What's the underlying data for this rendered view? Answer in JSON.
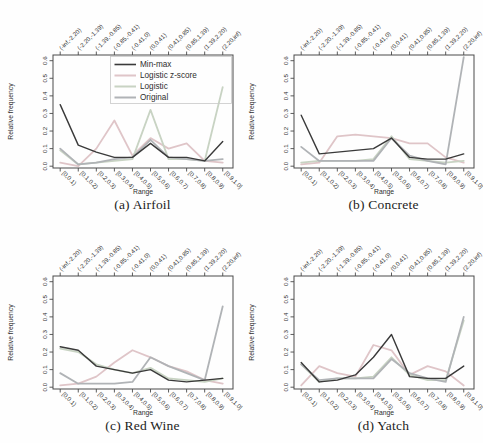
{
  "figure": {
    "background": "#fefefe",
    "frame_color": "#4a4a4a",
    "tick_color": "#4a4a4a"
  },
  "axes": {
    "ylabel": "Relative frequency",
    "xlabel": "Range",
    "yticks": [
      "0.0",
      "0.1",
      "0.2",
      "0.3",
      "0.4",
      "0.5",
      "0.6"
    ],
    "ylim": [
      0,
      0.6
    ],
    "x_categories_bottom": [
      "[0,0.1)",
      "[0.1,0.2)",
      "[0.2,0.3)",
      "[0.3,0.4)",
      "[0.4,0.5)",
      "[0.5,0.6)",
      "[0.6,0.7)",
      "[0.7,0.8)",
      "[0.8,0.9)",
      "[0.9,1.0]"
    ],
    "x_categories_top": [
      "(-inf,-2.20)",
      "(-2.20,-1.39)",
      "(-1.39,-0.85)",
      "(-0.85,-0.41)",
      "(-0.41,0)",
      "(0,0.41)",
      "(0.41,0.85)",
      "(0.85,1.39)",
      "(1.39,2.20)",
      "(2.20,inf)"
    ]
  },
  "legend": {
    "position": "top-right",
    "box_color": "#c9c9c9",
    "entries": [
      "Min-max",
      "Logistic z-score",
      "Logistic",
      "Original"
    ]
  },
  "series_styles": [
    {
      "name": "Min-max",
      "color": "#3a3a3a",
      "width": 1.4
    },
    {
      "name": "Logistic z-score",
      "color": "#dfc5c8",
      "width": 1.8
    },
    {
      "name": "Logistic",
      "color": "#c8d3c3",
      "width": 1.8
    },
    {
      "name": "Original",
      "color": "#b0b3b6",
      "width": 1.8
    }
  ],
  "chart_data": [
    {
      "type": "line",
      "caption": "(a) Airfoil",
      "show_legend": true,
      "categories": [
        "[0,0.1)",
        "[0.1,0.2)",
        "[0.2,0.3)",
        "[0.3,0.4)",
        "[0.4,0.5)",
        "[0.5,0.6)",
        "[0.6,0.7)",
        "[0.7,0.8)",
        "[0.8,0.9)",
        "[0.9,1.0]"
      ],
      "series": [
        {
          "name": "Min-max",
          "values": [
            0.35,
            0.12,
            0.08,
            0.05,
            0.05,
            0.13,
            0.05,
            0.05,
            0.03,
            0.14
          ]
        },
        {
          "name": "Logistic z-score",
          "values": [
            0.02,
            0.0,
            0.1,
            0.26,
            0.06,
            0.16,
            0.1,
            0.13,
            0.03,
            0.02
          ]
        },
        {
          "name": "Logistic",
          "values": [
            0.09,
            0.01,
            0.02,
            0.03,
            0.04,
            0.32,
            0.04,
            0.04,
            0.03,
            0.45
          ]
        },
        {
          "name": "Original",
          "values": [
            0.1,
            0.01,
            0.02,
            0.04,
            0.05,
            0.15,
            0.05,
            0.04,
            0.03,
            0.04
          ]
        }
      ]
    },
    {
      "type": "line",
      "caption": "(b) Concrete",
      "show_legend": false,
      "categories": [
        "[0,0.1)",
        "[0.1,0.2)",
        "[0.2,0.3)",
        "[0.3,0.4)",
        "[0.4,0.5)",
        "[0.5,0.6)",
        "[0.6,0.7)",
        "[0.7,0.8)",
        "[0.8,0.9)",
        "[0.9,1.0]"
      ],
      "series": [
        {
          "name": "Min-max",
          "values": [
            0.29,
            0.07,
            0.08,
            0.09,
            0.1,
            0.16,
            0.05,
            0.04,
            0.04,
            0.07
          ]
        },
        {
          "name": "Logistic z-score",
          "values": [
            0.01,
            0.02,
            0.17,
            0.18,
            0.17,
            0.16,
            0.13,
            0.13,
            0.05,
            0.02
          ]
        },
        {
          "name": "Logistic",
          "values": [
            0.02,
            0.03,
            0.03,
            0.03,
            0.04,
            0.17,
            0.04,
            0.03,
            0.02,
            0.03
          ]
        },
        {
          "name": "Original",
          "values": [
            0.11,
            0.03,
            0.03,
            0.03,
            0.03,
            0.16,
            0.06,
            0.03,
            0.01,
            0.62
          ]
        }
      ]
    },
    {
      "type": "line",
      "caption": "(c) Red Wine",
      "show_legend": false,
      "categories": [
        "[0,0.1)",
        "[0.1,0.2)",
        "[0.2,0.3)",
        "[0.3,0.4)",
        "[0.4,0.5)",
        "[0.5,0.6)",
        "[0.6,0.7)",
        "[0.7,0.8)",
        "[0.8,0.9)",
        "[0.9,1.0]"
      ],
      "series": [
        {
          "name": "Min-max",
          "values": [
            0.23,
            0.21,
            0.12,
            0.1,
            0.08,
            0.1,
            0.04,
            0.03,
            0.04,
            0.05
          ]
        },
        {
          "name": "Logistic z-score",
          "values": [
            0.01,
            0.02,
            0.06,
            0.14,
            0.21,
            0.17,
            0.12,
            0.09,
            0.04,
            0.02
          ]
        },
        {
          "name": "Logistic",
          "values": [
            0.22,
            0.2,
            0.13,
            0.1,
            0.08,
            0.11,
            0.05,
            0.04,
            0.03,
            0.05
          ]
        },
        {
          "name": "Original",
          "values": [
            0.08,
            0.02,
            0.02,
            0.02,
            0.03,
            0.17,
            0.12,
            0.08,
            0.04,
            0.46
          ]
        }
      ]
    },
    {
      "type": "line",
      "caption": "(d) Yatch",
      "show_legend": false,
      "categories": [
        "[0,0.1)",
        "[0.1,0.2)",
        "[0.2,0.3)",
        "[0.3,0.4)",
        "[0.4,0.5)",
        "[0.5,0.6)",
        "[0.6,0.7)",
        "[0.7,0.8)",
        "[0.8,0.9)",
        "[0.9,1.0]"
      ],
      "series": [
        {
          "name": "Min-max",
          "values": [
            0.14,
            0.03,
            0.04,
            0.07,
            0.17,
            0.3,
            0.06,
            0.05,
            0.05,
            0.12
          ]
        },
        {
          "name": "Logistic z-score",
          "values": [
            0.01,
            0.12,
            0.08,
            0.06,
            0.24,
            0.21,
            0.07,
            0.12,
            0.09,
            0.01
          ]
        },
        {
          "name": "Logistic",
          "values": [
            0.13,
            0.03,
            0.05,
            0.05,
            0.06,
            0.17,
            0.07,
            0.04,
            0.04,
            0.38
          ]
        },
        {
          "name": "Original",
          "values": [
            0.13,
            0.04,
            0.05,
            0.05,
            0.05,
            0.16,
            0.08,
            0.05,
            0.03,
            0.4
          ]
        }
      ]
    }
  ]
}
